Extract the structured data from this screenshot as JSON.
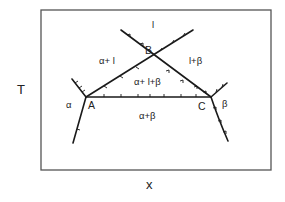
{
  "diagram": {
    "type": "binary phase diagram (eutectic / peritectic-style invariant)",
    "axes": {
      "y_label": "T",
      "x_label": "x"
    },
    "points": {
      "A": "A",
      "B": "B",
      "C": "C"
    },
    "regions": {
      "liquid": "l",
      "alpha_plus_liquid": "α+ l",
      "liquid_plus_beta": "l+β",
      "three_phase": "α+ l+β",
      "alpha": "α",
      "beta": "β",
      "alpha_plus_beta": "α+β"
    },
    "colors": {
      "line": "#1a1a1a",
      "frame": "#555555",
      "text": "#222222",
      "background": "#ffffff"
    }
  }
}
